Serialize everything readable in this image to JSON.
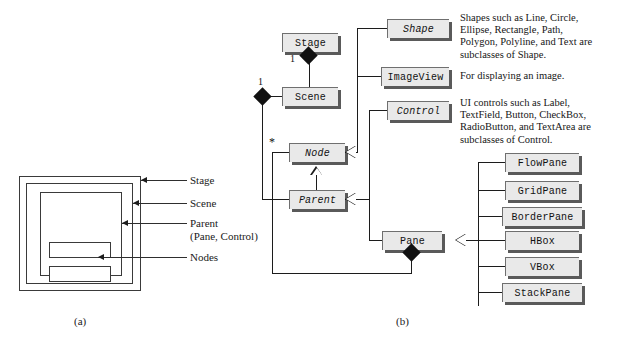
{
  "figure": {
    "caption_a": "(a)",
    "caption_b": "(b)"
  },
  "panel_a": {
    "labels": [
      {
        "id": "stage",
        "text": "Stage"
      },
      {
        "id": "scene",
        "text": "Scene"
      },
      {
        "id": "parent",
        "text": "Parent\n(Pane, Control)"
      },
      {
        "id": "nodes",
        "text": "Nodes"
      }
    ]
  },
  "panel_b": {
    "classes": [
      {
        "id": "stage",
        "name": "Stage",
        "abstract": false
      },
      {
        "id": "scene",
        "name": "Scene",
        "abstract": false
      },
      {
        "id": "node",
        "name": "Node",
        "abstract": true
      },
      {
        "id": "parent",
        "name": "Parent",
        "abstract": true
      },
      {
        "id": "shape",
        "name": "Shape",
        "abstract": true
      },
      {
        "id": "imageview",
        "name": "ImageView",
        "abstract": false
      },
      {
        "id": "control",
        "name": "Control",
        "abstract": true
      },
      {
        "id": "pane",
        "name": "Pane",
        "abstract": false
      },
      {
        "id": "flowpane",
        "name": "FlowPane",
        "abstract": false
      },
      {
        "id": "gridpane",
        "name": "GridPane",
        "abstract": false
      },
      {
        "id": "borderpane",
        "name": "BorderPane",
        "abstract": false
      },
      {
        "id": "hbox",
        "name": "HBox",
        "abstract": false
      },
      {
        "id": "vbox",
        "name": "VBox",
        "abstract": false
      },
      {
        "id": "stackpane",
        "name": "StackPane",
        "abstract": false
      }
    ],
    "multiplicities": [
      {
        "id": "stage-scene",
        "text": "1"
      },
      {
        "id": "scene-node",
        "text": "1"
      },
      {
        "id": "node-star",
        "text": "*"
      }
    ],
    "descriptions": [
      {
        "id": "shape-desc",
        "text": "Shapes such as Line, Circle,\nEllipse, Rectangle, Path,\nPolygon, Polyline, and Text are\nsubclasses of Shape."
      },
      {
        "id": "imageview-desc",
        "text": "For displaying an image."
      },
      {
        "id": "control-desc",
        "text": "UI controls such as Label,\nTextField, Button, CheckBox,\nRadioButton, and TextArea are\nsubclasses of Control."
      }
    ]
  },
  "colors": {
    "box_fill": "#e9e9e9",
    "box_border": "#6f6f6f",
    "box_shadow": "#5a5a5a",
    "line": "#1c1c1c",
    "text": "#111111",
    "background": "#ffffff"
  }
}
